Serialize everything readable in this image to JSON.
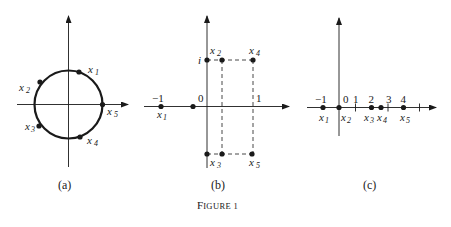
{
  "figure": {
    "caption_main": "F",
    "caption_rest": "IGURE 1",
    "panels": [
      {
        "id": "a",
        "caption": "(a)",
        "description": "unit circle in the complex plane with five points",
        "points": [
          {
            "label": "x",
            "sub": "1"
          },
          {
            "label": "x",
            "sub": "2"
          },
          {
            "label": "x",
            "sub": "3"
          },
          {
            "label": "x",
            "sub": "4"
          },
          {
            "label": "x",
            "sub": "5"
          }
        ]
      },
      {
        "id": "b",
        "caption": "(b)",
        "ticks": {
          "minus_one": "−1",
          "zero": "0",
          "one": "1",
          "i": "i"
        },
        "points": [
          {
            "label": "x",
            "sub": "1"
          },
          {
            "label": "x",
            "sub": "2"
          },
          {
            "label": "x",
            "sub": "3"
          },
          {
            "label": "x",
            "sub": "4"
          },
          {
            "label": "x",
            "sub": "5"
          }
        ]
      },
      {
        "id": "c",
        "caption": "(c)",
        "ticks": {
          "minus_one": "−1",
          "zero": "0",
          "one": "1",
          "two": "2",
          "three": "3",
          "four": "4"
        },
        "points": [
          {
            "label": "x",
            "sub": "1"
          },
          {
            "label": "x",
            "sub": "2"
          },
          {
            "label": "x",
            "sub": "3"
          },
          {
            "label": "x",
            "sub": "4"
          },
          {
            "label": "x",
            "sub": "5"
          }
        ]
      }
    ]
  },
  "colors": {
    "ink": "#1a1a1a",
    "background": "#ffffff"
  }
}
